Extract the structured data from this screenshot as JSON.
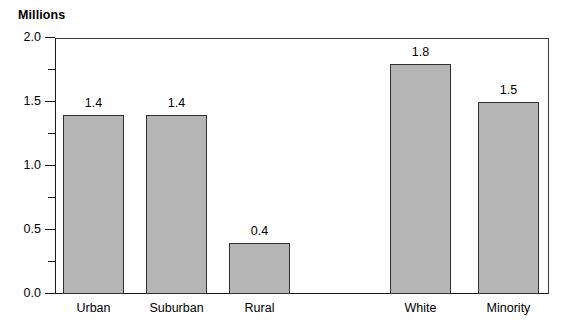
{
  "chart_data": {
    "type": "bar",
    "title": "",
    "ylabel": "Millions",
    "xlabel": "",
    "ylim": [
      0.0,
      2.0
    ],
    "grid": false,
    "legend": null,
    "categories": [
      "Urban",
      "Suburban",
      "Rural",
      "White",
      "Minority"
    ],
    "values": [
      1.4,
      1.4,
      0.4,
      1.8,
      1.5
    ],
    "value_labels": [
      "1.4",
      "1.4",
      "0.4",
      "1.8",
      "1.5"
    ],
    "ytick_labels": [
      "0.0",
      "0.5",
      "1.0",
      "1.5",
      "2.0"
    ],
    "ytick_values": [
      0.0,
      0.5,
      1.0,
      1.5,
      2.0
    ],
    "yminor_values": [
      0.25,
      0.75,
      1.25,
      1.75
    ],
    "group_gap_after_index": 2,
    "bar_color": "#b5b5b5",
    "bar_border_color": "#303030",
    "axis_color": "#1a1a1a"
  }
}
